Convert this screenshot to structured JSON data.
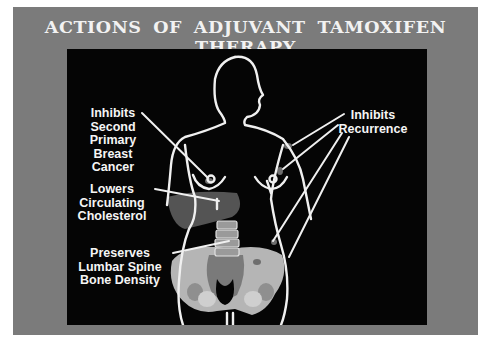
{
  "title": "ACTIONS OF ADJUVANT TAMOXIFEN THERAPY",
  "labels": {
    "second_primary": [
      "Inhibits",
      "Second",
      "Primary",
      "Breast",
      "Cancer"
    ],
    "cholesterol": [
      "Lowers",
      "Circulating",
      "Cholesterol"
    ],
    "bone_density": [
      "Preserves",
      "Lumbar Spine",
      "Bone Density"
    ],
    "recurrence": [
      "Inhibits",
      "Recurrence"
    ]
  },
  "colors": {
    "frame": "#7b7b7b",
    "panel": "#050505",
    "outline": "#f0f0f0",
    "liver": "#555555",
    "pelvis": "#b8b8b8",
    "sacrum": "#7a7a7a",
    "metastasis": "#6e6e6e"
  }
}
